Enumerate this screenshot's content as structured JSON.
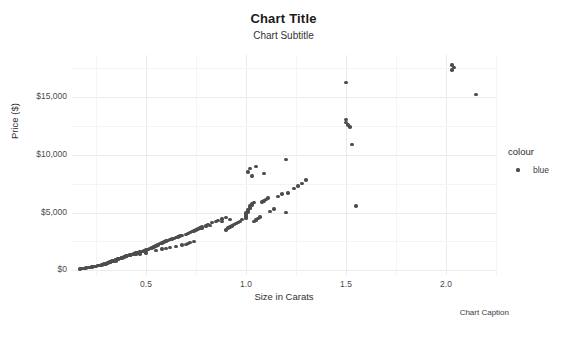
{
  "chart_data": {
    "type": "scatter",
    "title": "Chart Title",
    "subtitle": "Chart Subtitle",
    "caption": "Chart Caption",
    "xlabel": "Size in Carats",
    "ylabel": "Price ($)",
    "xlim": [
      0.13,
      2.25
    ],
    "ylim": [
      -400,
      18600
    ],
    "xticks": [
      0.5,
      1.0,
      1.5,
      2.0
    ],
    "xticklabels": [
      "0.5",
      "1.0",
      "1.5",
      "2.0"
    ],
    "yticks": [
      0,
      5000,
      10000,
      15000
    ],
    "yticklabels": [
      "$0",
      "$5,000",
      "$10,000",
      "$15,000"
    ],
    "grid": true,
    "grid_minor": true,
    "point_color": "#4d4d4d",
    "panel_background": "#ffffff",
    "grid_color": "#ebebeb",
    "legend": {
      "position": "right",
      "title": "colour",
      "entries": [
        {
          "label": "blue",
          "color": "#4d4d4d"
        }
      ]
    },
    "series": [
      {
        "name": "blue",
        "color": "#4d4d4d",
        "x": [
          0.17,
          0.18,
          0.19,
          0.2,
          0.21,
          0.22,
          0.23,
          0.23,
          0.24,
          0.25,
          0.26,
          0.26,
          0.27,
          0.28,
          0.28,
          0.29,
          0.29,
          0.3,
          0.3,
          0.3,
          0.3,
          0.31,
          0.31,
          0.31,
          0.32,
          0.32,
          0.32,
          0.33,
          0.33,
          0.33,
          0.34,
          0.34,
          0.34,
          0.35,
          0.35,
          0.35,
          0.36,
          0.36,
          0.36,
          0.37,
          0.37,
          0.38,
          0.38,
          0.38,
          0.39,
          0.39,
          0.4,
          0.4,
          0.4,
          0.41,
          0.41,
          0.42,
          0.42,
          0.43,
          0.43,
          0.44,
          0.44,
          0.45,
          0.45,
          0.46,
          0.47,
          0.47,
          0.48,
          0.49,
          0.5,
          0.5,
          0.51,
          0.51,
          0.52,
          0.52,
          0.53,
          0.53,
          0.54,
          0.54,
          0.55,
          0.55,
          0.56,
          0.56,
          0.57,
          0.58,
          0.58,
          0.59,
          0.6,
          0.6,
          0.61,
          0.62,
          0.63,
          0.64,
          0.65,
          0.66,
          0.67,
          0.68,
          0.7,
          0.7,
          0.71,
          0.71,
          0.72,
          0.72,
          0.73,
          0.74,
          0.74,
          0.75,
          0.76,
          0.77,
          0.78,
          0.8,
          0.81,
          0.83,
          0.85,
          0.86,
          0.88,
          0.9,
          0.9,
          0.91,
          0.92,
          0.93,
          0.94,
          0.95,
          0.96,
          0.97,
          0.98,
          1.0,
          1.0,
          1.0,
          1.0,
          1.0,
          1.01,
          1.01,
          1.01,
          1.02,
          1.02,
          1.02,
          1.03,
          1.03,
          1.04,
          1.04,
          1.05,
          1.05,
          1.06,
          1.07,
          1.08,
          1.09,
          1.1,
          1.11,
          1.12,
          1.14,
          1.16,
          1.18,
          1.2,
          1.21,
          1.24,
          1.26,
          1.28,
          1.3,
          1.01,
          1.02,
          1.03,
          1.05,
          1.09,
          1.2,
          1.5,
          1.5,
          1.51,
          1.52,
          1.53,
          1.55,
          1.5,
          2.03,
          2.03,
          2.04,
          2.15,
          0.6,
          0.62,
          0.65,
          0.68,
          0.45,
          0.47,
          0.5,
          0.33,
          0.35,
          0.38,
          0.4,
          0.42,
          0.55,
          0.58,
          0.78,
          0.8,
          0.82,
          0.88,
          0.92
        ],
        "y": [
          120,
          160,
          180,
          210,
          240,
          260,
          280,
          310,
          330,
          360,
          400,
          430,
          450,
          470,
          500,
          520,
          545,
          560,
          580,
          600,
          620,
          640,
          660,
          680,
          700,
          720,
          740,
          760,
          780,
          800,
          820,
          845,
          870,
          890,
          910,
          930,
          950,
          975,
          1000,
          1020,
          1045,
          1070,
          1090,
          1115,
          1140,
          1160,
          1185,
          1210,
          1240,
          1265,
          1290,
          1320,
          1345,
          1375,
          1400,
          1430,
          1460,
          1490,
          1520,
          1550,
          1580,
          1615,
          1650,
          1685,
          1720,
          1760,
          1795,
          1830,
          1870,
          1910,
          1950,
          1990,
          2030,
          2075,
          2120,
          2165,
          2210,
          2255,
          2300,
          2350,
          2400,
          2450,
          2500,
          2550,
          2600,
          2660,
          2720,
          2780,
          2840,
          2900,
          2960,
          3020,
          3120,
          2250,
          2300,
          3200,
          2400,
          3280,
          3350,
          2500,
          3420,
          3500,
          3580,
          3660,
          3740,
          3900,
          3980,
          4120,
          4250,
          4330,
          4450,
          4580,
          3500,
          3650,
          3750,
          3850,
          3950,
          4050,
          4150,
          4250,
          4400,
          4500,
          4600,
          4700,
          4800,
          4950,
          5050,
          5150,
          5250,
          5350,
          5450,
          5550,
          5650,
          5750,
          5850,
          4200,
          4300,
          4400,
          4500,
          4600,
          5900,
          6000,
          6100,
          6250,
          5100,
          5300,
          6400,
          6600,
          5000,
          6700,
          7100,
          7300,
          7500,
          7800,
          8500,
          8800,
          8150,
          9000,
          8350,
          9600,
          13050,
          12750,
          12550,
          12400,
          10900,
          5550,
          16250,
          17750,
          17300,
          17500,
          15200,
          1900,
          1980,
          2080,
          2200,
          1350,
          1420,
          1520,
          750,
          820,
          1080,
          1200,
          1300,
          1720,
          1840,
          3620,
          3780,
          3880,
          4200,
          4420
        ]
      }
    ]
  }
}
